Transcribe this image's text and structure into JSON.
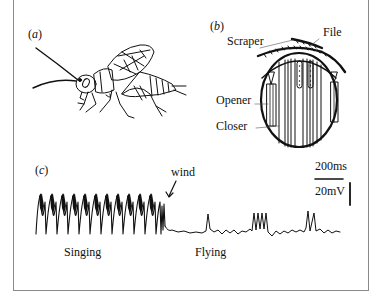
{
  "figure": {
    "panels": [
      {
        "id": "a",
        "label": "(a)",
        "letter": "a",
        "description": "Cricket illustration"
      },
      {
        "id": "b",
        "label": "(b)",
        "letter": "b",
        "description": "Cross-section of thorax with stridulation apparatus",
        "annotations": [
          "Scraper",
          "File",
          "Opener",
          "Closer"
        ]
      },
      {
        "id": "c",
        "label": "(c)",
        "letter": "c",
        "description": "Intracellular recording trace",
        "annotations": {
          "arrow": "wind",
          "phase_1": "Singing",
          "phase_2": "Flying"
        },
        "scale_bars": {
          "time": "200ms",
          "voltage": "20mV"
        }
      }
    ]
  },
  "text": {
    "a_open": "(",
    "a_letter": "a",
    "a_close": ")",
    "b_open": "(",
    "b_letter": "b",
    "b_close": ")",
    "c_open": "(",
    "c_letter": "c",
    "c_close": ")",
    "scraper": "Scraper",
    "file": "File",
    "opener": "Opener",
    "closer": "Closer",
    "wind": "wind",
    "time_scale": "200ms",
    "voltage_scale": "20mV",
    "singing": "Singing",
    "flying": "Flying"
  },
  "colors": {
    "ink": "#111111",
    "frame": "#8a8a8a",
    "background": "#ffffff"
  }
}
